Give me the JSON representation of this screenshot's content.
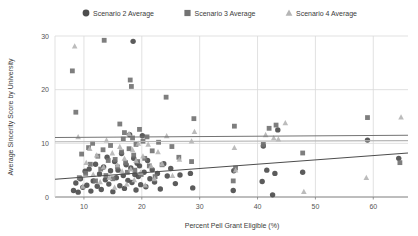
{
  "chart_data": {
    "type": "scatter",
    "title": "",
    "xlabel": "Percent Pell Grant Eligible (%)",
    "ylabel": "Average Sincerity Score by University",
    "xlim": [
      5,
      66
    ],
    "ylim": [
      0,
      30
    ],
    "xticks": [
      10,
      20,
      30,
      40,
      50,
      60
    ],
    "yticks": [
      0,
      10,
      20,
      30
    ],
    "grid": true,
    "legend_position": "top-center",
    "colors": {
      "scenario2": "#4d4d4d",
      "scenario3": "#737373",
      "scenario4": "#b5b5b5",
      "gridline": "#d9d9d9",
      "axis": "#808080",
      "text": "#3b3b3b"
    },
    "series": [
      {
        "name": "Scenario 2 Average",
        "marker": "circle",
        "color": "#4d4d4d",
        "trendline": {
          "x0": 5,
          "y0": 3.3,
          "x1": 66,
          "y1": 8.2
        },
        "points": [
          [
            8.2,
            1.2
          ],
          [
            8.6,
            2.6
          ],
          [
            9.0,
            0.9
          ],
          [
            9.4,
            3.4
          ],
          [
            9.8,
            1.8
          ],
          [
            10.2,
            4.8
          ],
          [
            10.5,
            2.2
          ],
          [
            10.9,
            5.2
          ],
          [
            11.2,
            1.1
          ],
          [
            11.6,
            3.0
          ],
          [
            12.0,
            6.1
          ],
          [
            12.3,
            2.0
          ],
          [
            12.7,
            4.3
          ],
          [
            13.0,
            1.4
          ],
          [
            13.4,
            5.6
          ],
          [
            13.7,
            3.2
          ],
          [
            14.0,
            7.4
          ],
          [
            14.3,
            2.4
          ],
          [
            14.6,
            4.9
          ],
          [
            15.0,
            1.0
          ],
          [
            15.3,
            6.6
          ],
          [
            15.6,
            3.6
          ],
          [
            15.9,
            5.0
          ],
          [
            16.2,
            2.1
          ],
          [
            16.5,
            8.1
          ],
          [
            16.8,
            4.0
          ],
          [
            17.0,
            1.6
          ],
          [
            17.3,
            6.0
          ],
          [
            17.6,
            3.1
          ],
          [
            17.9,
            11.6
          ],
          [
            18.1,
            5.4
          ],
          [
            18.3,
            2.7
          ],
          [
            18.5,
            29.0
          ],
          [
            18.6,
            7.2
          ],
          [
            18.8,
            4.2
          ],
          [
            19.0,
            1.3
          ],
          [
            19.2,
            6.3
          ],
          [
            19.4,
            3.8
          ],
          [
            19.6,
            5.8
          ],
          [
            19.8,
            2.3
          ],
          [
            20.1,
            11.4
          ],
          [
            20.4,
            4.6
          ],
          [
            20.7,
            1.9
          ],
          [
            21.0,
            6.8
          ],
          [
            21.4,
            3.4
          ],
          [
            21.8,
            5.1
          ],
          [
            22.2,
            2.8
          ],
          [
            22.7,
            4.4
          ],
          [
            23.2,
            1.5
          ],
          [
            23.8,
            6.2
          ],
          [
            24.4,
            3.9
          ],
          [
            25.0,
            5.3
          ],
          [
            25.8,
            2.5
          ],
          [
            26.6,
            4.1
          ],
          [
            28.4,
            4.4
          ],
          [
            28.8,
            1.7
          ],
          [
            35.8,
            1.2
          ],
          [
            35.9,
            4.9
          ],
          [
            40.8,
            2.9
          ],
          [
            41.0,
            9.5
          ],
          [
            41.6,
            5.0
          ],
          [
            42.6,
            0.4
          ],
          [
            43.0,
            4.4
          ],
          [
            43.5,
            12.5
          ],
          [
            47.8,
            4.6
          ],
          [
            59.0,
            10.6
          ],
          [
            64.4,
            7.2
          ]
        ]
      },
      {
        "name": "Scenario 3 Average",
        "marker": "square",
        "color": "#737373",
        "trendline": {
          "x0": 5,
          "y0": 11.1,
          "x1": 66,
          "y1": 11.5
        },
        "points": [
          [
            8.0,
            23.5
          ],
          [
            8.6,
            15.8
          ],
          [
            9.2,
            3.6
          ],
          [
            9.6,
            8.0
          ],
          [
            10.3,
            4.4
          ],
          [
            10.8,
            9.2
          ],
          [
            11.1,
            6.1
          ],
          [
            11.5,
            10.0
          ],
          [
            12.0,
            3.0
          ],
          [
            12.4,
            7.6
          ],
          [
            12.9,
            5.2
          ],
          [
            13.3,
            8.8
          ],
          [
            13.5,
            29.2
          ],
          [
            13.8,
            4.0
          ],
          [
            14.2,
            6.8
          ],
          [
            14.6,
            9.6
          ],
          [
            15.0,
            3.4
          ],
          [
            15.4,
            7.0
          ],
          [
            15.8,
            5.6
          ],
          [
            16.2,
            13.6
          ],
          [
            16.5,
            8.4
          ],
          [
            16.8,
            10.8
          ],
          [
            17.0,
            12.0
          ],
          [
            17.2,
            6.4
          ],
          [
            17.5,
            4.6
          ],
          [
            17.8,
            9.0
          ],
          [
            18.0,
            21.8
          ],
          [
            18.2,
            20.6
          ],
          [
            18.4,
            11.0
          ],
          [
            18.6,
            7.8
          ],
          [
            18.8,
            5.0
          ],
          [
            19.0,
            9.8
          ],
          [
            19.3,
            6.6
          ],
          [
            19.6,
            12.6
          ],
          [
            19.9,
            4.2
          ],
          [
            20.2,
            10.4
          ],
          [
            20.5,
            7.2
          ],
          [
            20.9,
            11.2
          ],
          [
            21.3,
            5.8
          ],
          [
            21.8,
            8.6
          ],
          [
            22.3,
            3.8
          ],
          [
            22.9,
            10.2
          ],
          [
            23.5,
            6.0
          ],
          [
            24.2,
            18.6
          ],
          [
            25.2,
            9.4
          ],
          [
            26.4,
            7.4
          ],
          [
            28.6,
            6.6
          ],
          [
            29.0,
            14.6
          ],
          [
            35.8,
            3.0
          ],
          [
            36.0,
            13.2
          ],
          [
            36.2,
            5.4
          ],
          [
            41.0,
            9.8
          ],
          [
            42.0,
            12.8
          ],
          [
            43.2,
            13.4
          ],
          [
            47.8,
            8.2
          ],
          [
            59.0,
            14.8
          ],
          [
            64.6,
            6.4
          ]
        ]
      },
      {
        "name": "Scenario 4 Average",
        "marker": "triangle",
        "color": "#b5b5b5",
        "trendline": {
          "x0": 5,
          "y0": 10.3,
          "x1": 66,
          "y1": 10.5
        },
        "points": [
          [
            8.4,
            28.1
          ],
          [
            9.0,
            11.2
          ],
          [
            9.8,
            2.0
          ],
          [
            10.4,
            6.4
          ],
          [
            11.0,
            9.0
          ],
          [
            11.6,
            4.2
          ],
          [
            12.2,
            7.8
          ],
          [
            12.8,
            2.8
          ],
          [
            13.4,
            5.6
          ],
          [
            13.9,
            10.6
          ],
          [
            14.4,
            3.6
          ],
          [
            14.9,
            8.2
          ],
          [
            15.3,
            1.8
          ],
          [
            15.8,
            6.0
          ],
          [
            16.2,
            9.4
          ],
          [
            16.6,
            4.8
          ],
          [
            17.0,
            7.2
          ],
          [
            17.4,
            2.4
          ],
          [
            17.8,
            11.8
          ],
          [
            18.1,
            5.2
          ],
          [
            18.4,
            8.8
          ],
          [
            18.7,
            3.2
          ],
          [
            19.0,
            6.8
          ],
          [
            19.4,
            10.0
          ],
          [
            19.8,
            4.6
          ],
          [
            20.2,
            7.6
          ],
          [
            20.6,
            2.2
          ],
          [
            21.1,
            9.8
          ],
          [
            21.6,
            5.8
          ],
          [
            22.2,
            3.4
          ],
          [
            22.8,
            8.4
          ],
          [
            23.5,
            6.2
          ],
          [
            24.3,
            11.4
          ],
          [
            25.3,
            4.0
          ],
          [
            26.5,
            7.0
          ],
          [
            28.6,
            10.4
          ],
          [
            29.1,
            12.2
          ],
          [
            36.0,
            9.2
          ],
          [
            36.2,
            5.0
          ],
          [
            41.4,
            11.6
          ],
          [
            42.8,
            11.0
          ],
          [
            43.6,
            10.8
          ],
          [
            44.8,
            13.8
          ],
          [
            48.0,
            1.0
          ],
          [
            58.8,
            3.6
          ],
          [
            64.8,
            14.9
          ]
        ]
      }
    ]
  },
  "legend": {
    "items": [
      {
        "label": "Scenario 2 Average",
        "marker": "circle"
      },
      {
        "label": "Scenario 3 Average",
        "marker": "square"
      },
      {
        "label": "Scenario 4 Average",
        "marker": "triangle"
      }
    ]
  }
}
